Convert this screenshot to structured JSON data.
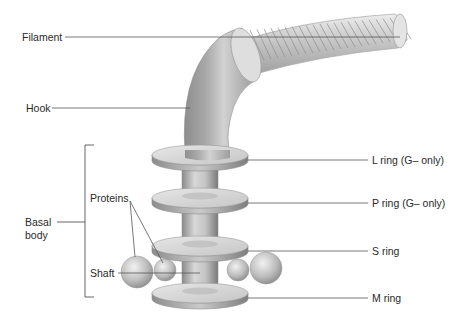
{
  "labels": {
    "filament": "Filament",
    "hook": "Hook",
    "basal_body_line1": "Basal",
    "basal_body_line2": "body",
    "proteins": "Proteins",
    "shaft": "Shaft",
    "l_ring": "L ring (G– only)",
    "p_ring": "P ring (G– only)",
    "s_ring": "S ring",
    "m_ring": "M ring"
  },
  "colors": {
    "background": "#ffffff",
    "leader_line": "#555555",
    "ring_top": "#dcdcdc",
    "ring_edge": "#9a9a9a",
    "shaft": "#bdbdbd",
    "hook": "#9e9e9e",
    "filament": "#c8c8c8",
    "text": "#2a2a2a"
  }
}
